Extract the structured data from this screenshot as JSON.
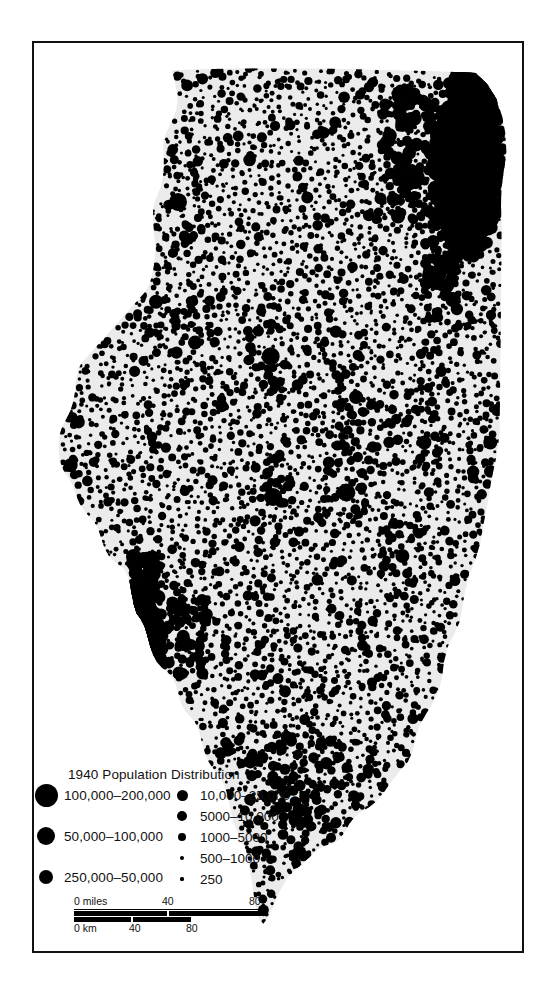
{
  "map": {
    "region_name": "Illinois",
    "land_fill_color": "#ebebeb",
    "dot_color": "#000000",
    "frame_color": "#111111",
    "background_color": "#ffffff"
  },
  "legend": {
    "title": "1940 Population Distribution",
    "left_column": [
      {
        "label": "100,000–200,000",
        "dot_px": 23
      },
      {
        "label": "50,000–100,000",
        "dot_px": 18
      },
      {
        "label": "250,000–50,000",
        "dot_px": 14
      }
    ],
    "right_column": [
      {
        "label": "10,000–25,000",
        "dot_px": 11
      },
      {
        "label": "5000–10,000",
        "dot_px": 9.5
      },
      {
        "label": "1000–5000",
        "dot_px": 8
      },
      {
        "label": "500–1000",
        "dot_px": 4.5
      },
      {
        "label": "250",
        "dot_px": 3.2
      }
    ]
  },
  "scalebar": {
    "miles": {
      "unit_label": "0 miles",
      "ticks": [
        "40",
        "80"
      ],
      "max": 80
    },
    "km": {
      "unit_label": "0 km",
      "ticks": [
        "40",
        "80"
      ],
      "max": 80
    }
  },
  "chart_data": {
    "type": "scatter",
    "title": "1940 Population Distribution",
    "subtitle": "",
    "xlabel": "",
    "ylabel": "",
    "legend_position": "bottom-left",
    "grid": false,
    "size_classes": [
      {
        "label": "250",
        "min": 0,
        "max": 250,
        "radius_px": 1.6
      },
      {
        "label": "500–1000",
        "min": 500,
        "max": 1000,
        "radius_px": 2.3
      },
      {
        "label": "1000–5000",
        "min": 1000,
        "max": 5000,
        "radius_px": 4.0
      },
      {
        "label": "5000–10,000",
        "min": 5000,
        "max": 10000,
        "radius_px": 4.8
      },
      {
        "label": "10,000–25,000",
        "min": 10000,
        "max": 25000,
        "radius_px": 5.5
      },
      {
        "label": "250,000–50,000",
        "min": 25000,
        "max": 50000,
        "radius_px": 7.0
      },
      {
        "label": "50,000–100,000",
        "min": 50000,
        "max": 100000,
        "radius_px": 9.0
      },
      {
        "label": "100,000–200,000",
        "min": 100000,
        "max": 200000,
        "radius_px": 11.5
      }
    ],
    "major_clusters": [
      {
        "name": "Chicago metropolitan area",
        "x": 0.9,
        "y": 0.115,
        "class": "100,000–200,000"
      },
      {
        "name": "East St. Louis area",
        "x": 0.225,
        "y": 0.655,
        "class": "100,000–200,000"
      },
      {
        "name": "Peoria",
        "x": 0.485,
        "y": 0.345,
        "class": "50,000–100,000"
      },
      {
        "name": "Rockford",
        "x": 0.295,
        "y": 0.175,
        "class": "50,000–100,000"
      },
      {
        "name": "Springfield",
        "x": 0.49,
        "y": 0.5,
        "class": "50,000–100,000"
      },
      {
        "name": "Decatur",
        "x": 0.64,
        "y": 0.495,
        "class": "50,000–100,000"
      },
      {
        "name": "Quincy",
        "x": 0.075,
        "y": 0.465,
        "class": "250,000–50,000"
      },
      {
        "name": "Joliet",
        "x": 0.855,
        "y": 0.195,
        "class": "250,000–50,000"
      },
      {
        "name": "Danville",
        "x": 0.935,
        "y": 0.44,
        "class": "250,000–50,000"
      },
      {
        "name": "Champaign-Urbana",
        "x": 0.8,
        "y": 0.44,
        "class": "250,000–50,000"
      },
      {
        "name": "Bloomington",
        "x": 0.66,
        "y": 0.39,
        "class": "250,000–50,000"
      },
      {
        "name": "Moline-Rock Island",
        "x": 0.25,
        "y": 0.285,
        "class": "250,000–50,000"
      },
      {
        "name": "Elgin",
        "x": 0.845,
        "y": 0.12,
        "class": "250,000–50,000"
      },
      {
        "name": "Waukegan",
        "x": 0.905,
        "y": 0.055,
        "class": "250,000–50,000"
      },
      {
        "name": "Alton",
        "x": 0.255,
        "y": 0.61,
        "class": "250,000–50,000"
      },
      {
        "name": "Galesburg",
        "x": 0.33,
        "y": 0.33,
        "class": "250,000–50,000"
      },
      {
        "name": "Mattoon",
        "x": 0.755,
        "y": 0.565,
        "class": "250,000–50,000"
      },
      {
        "name": "Centralia",
        "x": 0.5,
        "y": 0.7,
        "class": "10,000–25,000"
      },
      {
        "name": "Mount Vernon",
        "x": 0.555,
        "y": 0.745,
        "class": "10,000–25,000"
      },
      {
        "name": "Marion-Herrin",
        "x": 0.545,
        "y": 0.845,
        "class": "250,000–50,000"
      },
      {
        "name": "Cairo",
        "x": 0.47,
        "y": 0.955,
        "class": "10,000–25,000"
      }
    ],
    "total_dots_approx": 2400,
    "note": "Dot map; each dot sized by settlement population class."
  }
}
